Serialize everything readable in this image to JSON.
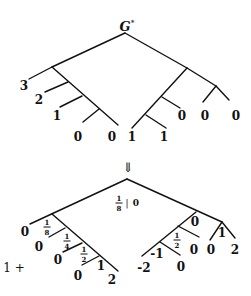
{
  "top_tree": {
    "title": "G",
    "title_sup": "*",
    "labels": {
      "l3": "3",
      "l2": "2",
      "l1": "1",
      "l0a": "0",
      "l0b": "0",
      "r1a": "1",
      "r1b": "1",
      "r0a": "0",
      "r0b": "0",
      "r0c": "0"
    }
  },
  "arrow": "⇓",
  "bottom_tree": {
    "root_value": {
      "num": "1",
      "den": "8",
      "sep": "|",
      "right": "0"
    },
    "prefix": "1 +",
    "left_labels": {
      "o0": "0",
      "o1": "0",
      "o2": "0",
      "o3": "0",
      "end": "2",
      "n1": "1"
    },
    "left_fracs": [
      {
        "num": "1",
        "den": "8"
      },
      {
        "num": "1",
        "den": "4"
      },
      {
        "num": "1",
        "den": "2"
      }
    ],
    "right_labels": {
      "n0": "0",
      "n1": "1",
      "m1": "-1",
      "m2": "-2",
      "z1": "0",
      "z2": "0",
      "z3": "0",
      "two": "2"
    },
    "right_frac": {
      "num": "1",
      "den": "2"
    }
  }
}
